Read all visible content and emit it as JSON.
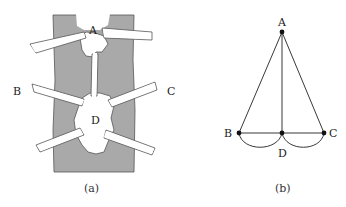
{
  "panels": [
    {
      "id": "a",
      "caption": "(a)",
      "description": "Map of river with two islands and seven bridges",
      "labels": {
        "A": "A",
        "B": "B",
        "C": "C",
        "D": "D"
      },
      "colors": {
        "river": "#a9a9a9",
        "land": "#ffffff",
        "outline": "#444444"
      }
    },
    {
      "id": "b",
      "caption": "(b)",
      "description": "Graph with vertices A, B, C, D and seven edges",
      "labels": {
        "A": "A",
        "B": "B",
        "C": "C",
        "D": "D"
      },
      "vertices": [
        {
          "name": "A",
          "x": 282,
          "y": 32
        },
        {
          "name": "B",
          "x": 239,
          "y": 133
        },
        {
          "name": "D",
          "x": 282,
          "y": 133
        },
        {
          "name": "C",
          "x": 324,
          "y": 133
        }
      ],
      "edges": [
        [
          "A",
          "B"
        ],
        [
          "A",
          "C"
        ],
        [
          "A",
          "D"
        ],
        [
          "B",
          "D"
        ],
        [
          "B",
          "D"
        ],
        [
          "D",
          "C"
        ],
        [
          "D",
          "C"
        ]
      ],
      "colors": {
        "edge": "#222222",
        "vertex": "#111111"
      }
    }
  ]
}
